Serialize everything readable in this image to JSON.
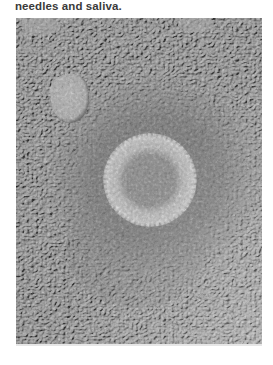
{
  "document": {
    "text_fragment": "needles and saliva."
  },
  "figure": {
    "colors": {
      "background_texture": "#a8a8a8",
      "halo": "#7c7c7c",
      "particle_rim": "#c8c8c8",
      "particle_core": "#8a8a8a",
      "blob": "#b8b8b8"
    }
  }
}
